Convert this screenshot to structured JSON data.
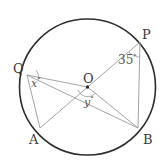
{
  "figure": {
    "background_color": "#ffffff",
    "circle": {
      "center_label": "O",
      "center_x": 87.5,
      "center_y": 87.0,
      "radius": 68.0,
      "stroke_color": "#2e2e2e",
      "stroke_width": 1.6
    },
    "chord_color": "#9a9a9a",
    "chord_width": 0.9,
    "points": [
      {
        "id": "P",
        "label": "P",
        "x": 140.0,
        "y": 42.0,
        "label_x": 142,
        "label_y": 28
      },
      {
        "id": "Q",
        "label": "Q",
        "x": 27.0,
        "y": 75.0,
        "label_x": 13,
        "label_y": 62
      },
      {
        "id": "A",
        "label": "A",
        "x": 40.0,
        "y": 128.0,
        "label_x": 29,
        "label_y": 133
      },
      {
        "id": "B",
        "label": "B",
        "x": 138.0,
        "y": 128.0,
        "label_x": 143,
        "label_y": 133
      },
      {
        "id": "O",
        "label": "O",
        "x": 87.5,
        "y": 87.0,
        "label_x": 83,
        "label_y": 72
      }
    ],
    "segments": [
      {
        "name": "chord-Q-B",
        "from": "Q",
        "to": "B"
      },
      {
        "name": "chord-A-P",
        "from": "A",
        "to": "P"
      },
      {
        "name": "chord-Q-A",
        "from": "Q",
        "to": "A"
      },
      {
        "name": "chord-P-B",
        "from": "P",
        "to": "B"
      },
      {
        "name": "radius-O-Q",
        "from": "O",
        "to": "Q"
      },
      {
        "name": "radius-O-B",
        "from": "O",
        "to": "B"
      }
    ],
    "angles": [
      {
        "id": "x",
        "label": "x",
        "degree_symbol": "°",
        "vertex": "Q",
        "label_x": 31,
        "label_y": 77
      },
      {
        "id": "y",
        "label": "y",
        "degree_symbol": "°",
        "vertex": "O",
        "label_x": 84,
        "label_y": 96
      },
      {
        "id": "angle-35",
        "label": "35",
        "degree_symbol": "°",
        "vertex": "P",
        "label_x": 118,
        "label_y": 54
      }
    ],
    "center_dot_color": "#2e2e2e"
  }
}
